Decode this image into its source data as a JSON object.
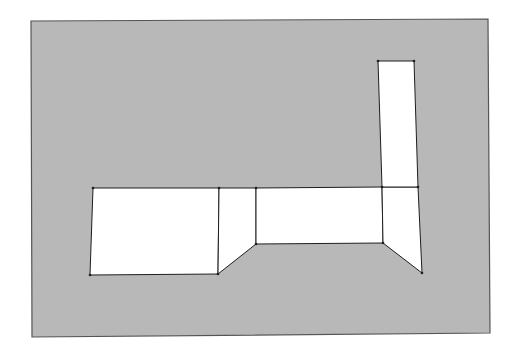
{
  "diagram": {
    "type": "line-drawing",
    "colors": {
      "page": "#ffffff",
      "background_panel": "#b8b8b8",
      "shape_fill": "#ffffff",
      "stroke": "#1e1e1e",
      "frame_stroke": "#555555"
    },
    "panels": [
      {
        "id": "left-block",
        "label": ""
      },
      {
        "id": "left-connector",
        "label": ""
      },
      {
        "id": "middle-block",
        "label": ""
      },
      {
        "id": "right-connector",
        "label": ""
      },
      {
        "id": "tall-block",
        "label": ""
      }
    ]
  }
}
